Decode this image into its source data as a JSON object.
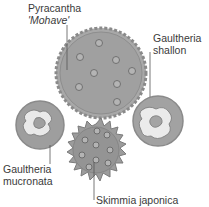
{
  "diagram": {
    "title": "",
    "labels": {
      "pyracantha_line1": "Pyracantha",
      "pyracantha_line2": "'Mohave'",
      "gaultheria_shallon_line1": "Gaultheria",
      "gaultheria_shallon_line2": "shallon",
      "gaultheria_mucronata_line1": "Gaultheria",
      "gaultheria_mucronata_line2": "mucronata",
      "skimmia": "Skimmia japonica"
    },
    "colors": {
      "shrub_fill": "#9a9a9a",
      "shrub_dark": "#7d7d7d",
      "shrub_edge": "#8a8a8a",
      "pale_patch": "#e9e9e9",
      "leader_line": "#555555",
      "text": "#3a3a3a"
    }
  }
}
